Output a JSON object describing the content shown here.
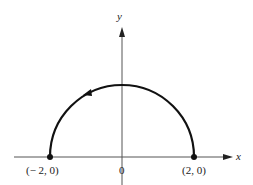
{
  "axes": {
    "x_label": "x",
    "y_label": "y",
    "origin_label": "0"
  },
  "points": [
    {
      "label": "(− 2, 0)",
      "x": -2,
      "y": 0
    },
    {
      "label": "(2, 0)",
      "x": 2,
      "y": 0
    }
  ],
  "curve": {
    "type": "upper semicircle",
    "center": [
      0,
      0
    ],
    "radius": 2,
    "direction": "counterclockwise"
  },
  "colors": {
    "axis": "#555555",
    "curve": "#111111"
  }
}
